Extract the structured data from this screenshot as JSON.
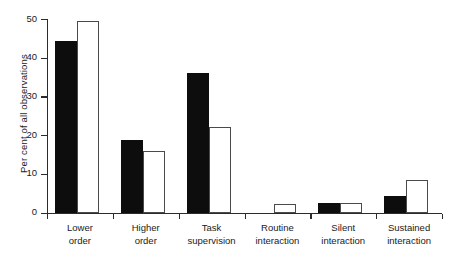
{
  "chart_data": {
    "type": "bar",
    "title": "",
    "xlabel": "",
    "ylabel": "Per cent of all observations",
    "ylim": [
      0,
      50
    ],
    "ytickstep": 10,
    "yticks": [
      "0",
      "10",
      "20",
      "30",
      "40",
      "50"
    ],
    "grid": false,
    "legend": "none",
    "categories": [
      "Lower order",
      "Higher order",
      "Task supervision",
      "Routine interaction",
      "Silent interaction",
      "Sustained interaction"
    ],
    "categories_wrapped": [
      [
        "Lower",
        "order"
      ],
      [
        "Higher",
        "order"
      ],
      [
        "Task",
        "supervision"
      ],
      [
        "Routine",
        "interaction"
      ],
      [
        "Silent",
        "interaction"
      ],
      [
        "Sustained",
        "interaction"
      ]
    ],
    "series": [
      {
        "name": "filled",
        "style": "solid-black",
        "color": "#0d0d0d",
        "values": [
          44.3,
          18.8,
          36.0,
          0,
          2.5,
          4.3
        ]
      },
      {
        "name": "hollow",
        "style": "open-white",
        "color": "#ffffff",
        "values": [
          49.5,
          16.0,
          22.0,
          2.2,
          2.5,
          8.5
        ]
      }
    ]
  }
}
